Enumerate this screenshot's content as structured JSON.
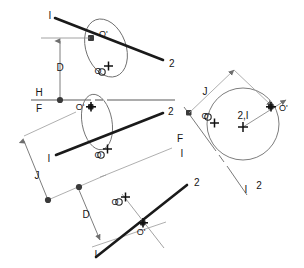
{
  "figure": {
    "background_color": "#ffffff",
    "heavy_line_color": "#1a1a1a",
    "thin_line_color": "#6e6e6e",
    "marker_color": "#3a3a3a",
    "text_color": "#151515"
  },
  "views": {
    "front_view": {
      "name": "front-view",
      "line_start_label": "I",
      "line_end_label": "2",
      "revolved_point_label": "O'",
      "true_point_label": "O",
      "dimension_label": "D",
      "ellipse": {
        "cx": 105,
        "cy": 48,
        "rx": 21,
        "ry": 30,
        "rotation": -22
      }
    },
    "fold_line_hf": {
      "name": "fold-line-h-f",
      "upper_label": "H",
      "lower_label": "F",
      "point_label": "O'"
    },
    "top_view": {
      "name": "top-view",
      "line_start_label": "I",
      "line_end_label": "2",
      "revolved_point_label": "O'",
      "true_point_label": "O",
      "dimension_label": "J",
      "ellipse": {
        "cx": 96,
        "cy": 122,
        "rx": 16,
        "ry": 28,
        "rotation": -12
      }
    },
    "fold_line_fi": {
      "name": "fold-line-f-i",
      "upper_label": "F",
      "lower_label": "I"
    },
    "auxiliary_view_1": {
      "name": "auxiliary-view-point-view",
      "point_view_label": "2,I",
      "true_point_label": "O",
      "revolved_point_label": "O'",
      "dimension_label": "J",
      "circle": {
        "cx": 242,
        "cy": 122,
        "r": 36
      }
    },
    "fold_line_i2": {
      "name": "fold-line-i-2",
      "upper_label": "I",
      "lower_label": "2"
    },
    "auxiliary_view_2": {
      "name": "auxiliary-view-edge-view",
      "line_start_label": "I",
      "line_end_label": "2",
      "true_point_label": "O",
      "revolved_point_label": "O'",
      "dimension_label": "D"
    }
  },
  "labels": {
    "line_1": "I",
    "line_2": "2",
    "point_o": "O",
    "point_o_prime": "O'",
    "dim_d": "D",
    "dim_j": "J",
    "plane_h": "H",
    "plane_f": "F",
    "point_view_21": "2,I"
  }
}
